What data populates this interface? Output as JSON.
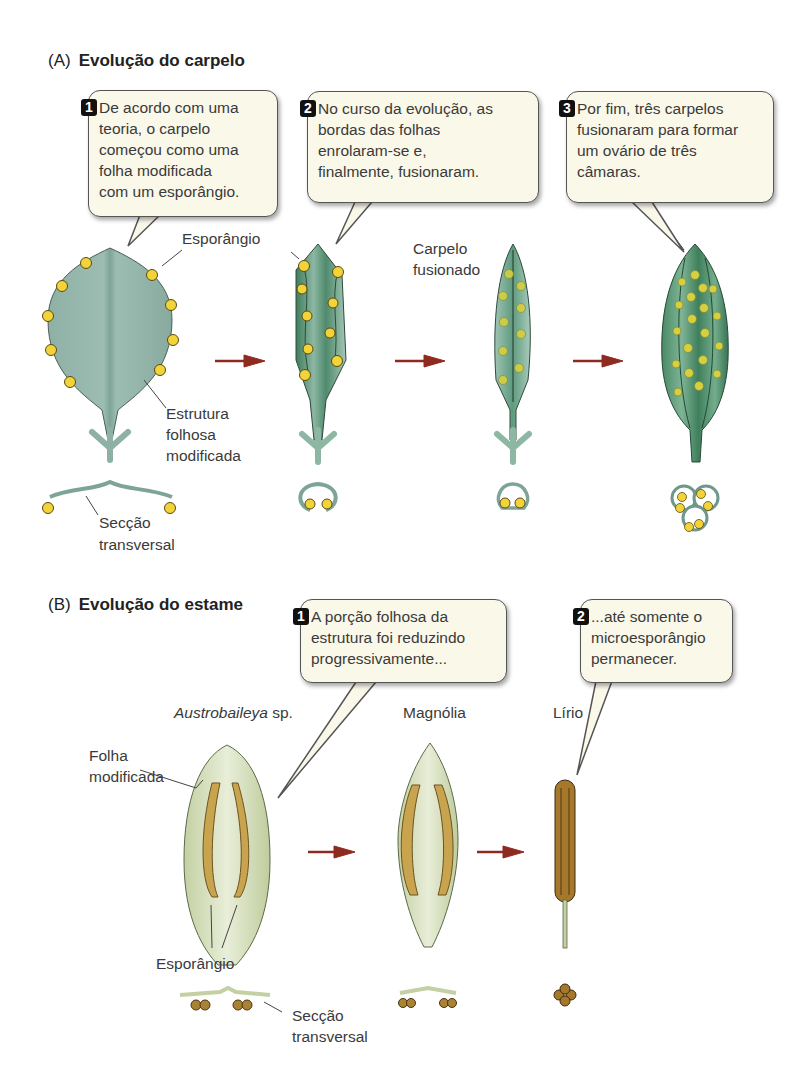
{
  "section_a": {
    "tag": "(A)",
    "title": "Evolução do carpelo",
    "steps": [
      {
        "number": "1",
        "lines": [
          "De acordo com uma",
          "teoria, o carpelo",
          "começou como uma",
          "folha modificada",
          "com um esporângio."
        ]
      },
      {
        "number": "2",
        "lines": [
          "No curso da evolução, as",
          "bordas das folhas",
          "enrolaram-se e,",
          "finalmente, fusionaram."
        ]
      },
      {
        "number": "3",
        "lines": [
          "Por fim, três carpelos",
          "fusionaram para formar",
          "um ovário de três",
          "câmaras."
        ]
      }
    ],
    "labels": {
      "esporangio": "Esporângio",
      "estrutura_1": "Estrutura",
      "estrutura_2": "folhosa",
      "estrutura_3": "modificada",
      "seccao_1": "Secção",
      "seccao_2": "transversal",
      "carpelo_1": "Carpelo",
      "carpelo_2": "fusionado"
    }
  },
  "section_b": {
    "tag": "(B)",
    "title": "Evolução do estame",
    "steps": [
      {
        "number": "1",
        "lines": [
          "A porção folhosa da",
          "estrutura foi reduzindo",
          "progressivamente..."
        ]
      },
      {
        "number": "2",
        "lines": [
          "...até somente o",
          "microesporângio",
          "permanecer."
        ]
      }
    ],
    "species": {
      "austro_italic": "Austrobaileya",
      "austro_suffix": " sp.",
      "magnolia": "Magnólia",
      "lirio": "Lírio"
    },
    "labels": {
      "folha_1": "Folha",
      "folha_2": "modificada",
      "esporangio": "Esporângio",
      "seccao_1": "Secção",
      "seccao_2": "transversal"
    }
  },
  "colors": {
    "leaf_green": "#8fb3a8",
    "leaf_dark_green": "#4f8a6c",
    "sporangium_yellow": "#f2d43a",
    "stamen_leaf": "#d5dfb9",
    "stamen_sporangium": "#c9a44f",
    "arrow_red": "#8e2a20",
    "bubble_fill": "#faf8e9"
  }
}
